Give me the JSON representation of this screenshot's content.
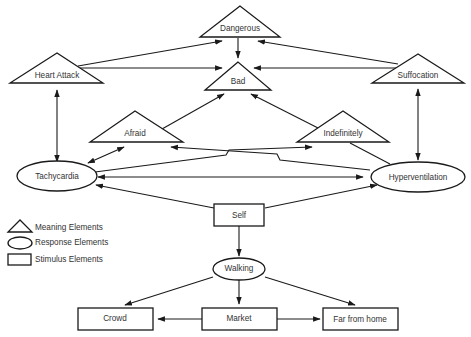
{
  "diagram": {
    "nodes": {
      "dangerous": {
        "label": "Dangerous",
        "type": "meaning"
      },
      "heart_attack": {
        "label": "Heart Attack",
        "type": "meaning"
      },
      "bad": {
        "label": "Bad",
        "type": "meaning"
      },
      "suffocation": {
        "label": "Suffocation",
        "type": "meaning"
      },
      "afraid": {
        "label": "Afraid",
        "type": "meaning"
      },
      "indefinitely": {
        "label": "Indefinitely",
        "type": "meaning"
      },
      "tachycardia": {
        "label": "Tachycardia",
        "type": "response"
      },
      "hyperventilation": {
        "label": "Hyperventilation",
        "type": "response"
      },
      "self": {
        "label": "Self",
        "type": "stimulus"
      },
      "walking": {
        "label": "Walking",
        "type": "response"
      },
      "crowd": {
        "label": "Crowd",
        "type": "stimulus"
      },
      "market": {
        "label": "Market",
        "type": "stimulus"
      },
      "far_from_home": {
        "label": "Far from home",
        "type": "stimulus"
      }
    },
    "edges": [
      {
        "from": "heart_attack",
        "to": "dangerous"
      },
      {
        "from": "suffocation",
        "to": "dangerous"
      },
      {
        "from": "dangerous",
        "to": "bad"
      },
      {
        "from": "heart_attack",
        "to": "bad"
      },
      {
        "from": "suffocation",
        "to": "bad"
      },
      {
        "from": "afraid",
        "to": "bad"
      },
      {
        "from": "indefinitely",
        "to": "bad"
      },
      {
        "from": "heart_attack",
        "to": "tachycardia",
        "bidirectional": true
      },
      {
        "from": "suffocation",
        "to": "hyperventilation",
        "bidirectional": true
      },
      {
        "from": "tachycardia",
        "to": "afraid",
        "bidirectional": true
      },
      {
        "from": "tachycardia",
        "to": "indefinitely"
      },
      {
        "from": "hyperventilation",
        "to": "afraid"
      },
      {
        "from": "tachycardia",
        "to": "hyperventilation",
        "bidirectional": true
      },
      {
        "from": "self",
        "to": "tachycardia"
      },
      {
        "from": "self",
        "to": "hyperventilation"
      },
      {
        "from": "self",
        "to": "walking"
      },
      {
        "from": "walking",
        "to": "crowd"
      },
      {
        "from": "walking",
        "to": "market"
      },
      {
        "from": "walking",
        "to": "far_from_home"
      },
      {
        "from": "market",
        "to": "crowd"
      },
      {
        "from": "market",
        "to": "far_from_home"
      }
    ]
  },
  "legend": {
    "meaning": "Meaning Elements",
    "response": "Response Elements",
    "stimulus": "Stimulus Elements"
  }
}
